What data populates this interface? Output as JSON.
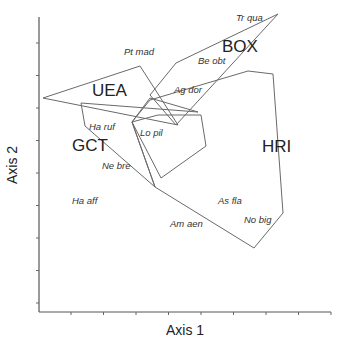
{
  "chart_data": {
    "type": "scatter",
    "title": "",
    "xlabel": "Axis 1",
    "ylabel": "Axis 2",
    "grid": false,
    "x_tick_count": 9,
    "y_tick_count": 9,
    "tick_labels_shown": false,
    "groups": [
      {
        "name": "UEA",
        "label_pos": [
          92,
          96
        ],
        "hull": [
          [
            43,
            98
          ],
          [
            140,
            66
          ],
          [
            178,
            125
          ]
        ]
      },
      {
        "name": "BOX",
        "label_pos": [
          222,
          52
        ],
        "hull": [
          [
            150,
            95
          ],
          [
            176,
            63
          ],
          [
            278,
            14
          ],
          [
            176,
            125
          ]
        ]
      },
      {
        "name": "GCT",
        "label_pos": [
          72,
          151
        ],
        "hull": [
          [
            81,
            103
          ],
          [
            198,
            112
          ],
          [
            150,
            98
          ],
          [
            132,
            122
          ],
          [
            155,
            187
          ],
          [
            85,
            126
          ]
        ]
      },
      {
        "name": "HRI",
        "label_pos": [
          262,
          152
        ],
        "hull": [
          [
            132,
            122
          ],
          [
            150,
            100
          ],
          [
            248,
            71
          ],
          [
            273,
            74
          ],
          [
            283,
            213
          ],
          [
            254,
            248
          ],
          [
            155,
            187
          ]
        ]
      },
      {
        "name": "LoPil",
        "label_pos": [
          138,
          135
        ],
        "hull": [
          [
            132,
            122
          ],
          [
            158,
            115
          ],
          [
            201,
            115
          ],
          [
            206,
            146
          ],
          [
            161,
            178
          ]
        ]
      }
    ],
    "species": [
      {
        "label": "Tr qua",
        "x": 236,
        "y": 21
      },
      {
        "label": "Pt mad",
        "x": 124,
        "y": 55
      },
      {
        "label": "Be obt",
        "x": 198,
        "y": 64
      },
      {
        "label": "Ag dor",
        "x": 174,
        "y": 93
      },
      {
        "label": "Ha ruf",
        "x": 89,
        "y": 130
      },
      {
        "label": "Lo pil",
        "x": 140,
        "y": 136
      },
      {
        "label": "Ne bre",
        "x": 102,
        "y": 169
      },
      {
        "label": "Ha aff",
        "x": 72,
        "y": 204
      },
      {
        "label": "As fla",
        "x": 218,
        "y": 204
      },
      {
        "label": "No big",
        "x": 244,
        "y": 223
      },
      {
        "label": "Am aen",
        "x": 170,
        "y": 227
      }
    ]
  },
  "axes": {
    "x_label": "Axis 1",
    "y_label": "Axis 2"
  }
}
